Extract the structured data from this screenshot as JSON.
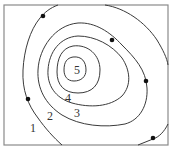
{
  "diagram": {
    "type": "contour-map",
    "frame": {
      "x": 4,
      "y": 5,
      "width": 164,
      "height": 140,
      "color": "#8a8a8a"
    },
    "contour_color": "#3a3a3a",
    "dot_color": "#111111",
    "labels": [
      {
        "id": "label-1",
        "text": "1",
        "x": 30,
        "y": 132
      },
      {
        "id": "label-2",
        "text": "2",
        "x": 47,
        "y": 120
      },
      {
        "id": "label-3",
        "text": "3",
        "x": 74,
        "y": 117
      },
      {
        "id": "label-4",
        "text": "4",
        "x": 65,
        "y": 102
      },
      {
        "id": "label-5",
        "text": "5",
        "x": 74,
        "y": 74
      }
    ],
    "dots": [
      {
        "x": 43,
        "y": 16
      },
      {
        "x": 112,
        "y": 40
      },
      {
        "x": 146,
        "y": 81
      },
      {
        "x": 28,
        "y": 99
      },
      {
        "x": 153,
        "y": 138
      }
    ]
  }
}
